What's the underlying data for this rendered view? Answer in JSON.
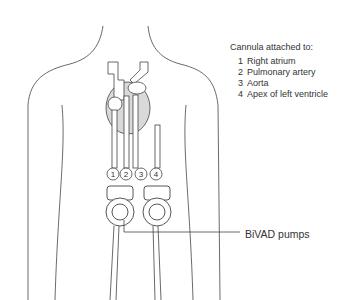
{
  "legend": {
    "title": "Cannula attached to:",
    "items": [
      {
        "num": "1",
        "label": "Right atrium"
      },
      {
        "num": "2",
        "label": "Pulmonary artery"
      },
      {
        "num": "3",
        "label": "Aorta"
      },
      {
        "num": "4",
        "label": "Apex of left ventricle"
      }
    ]
  },
  "markers": [
    "1",
    "2",
    "3",
    "4"
  ],
  "pump_label": "BiVAD pumps",
  "colors": {
    "outline": "#444444",
    "heart_fill": "#d9d9d9",
    "text": "#333333"
  }
}
